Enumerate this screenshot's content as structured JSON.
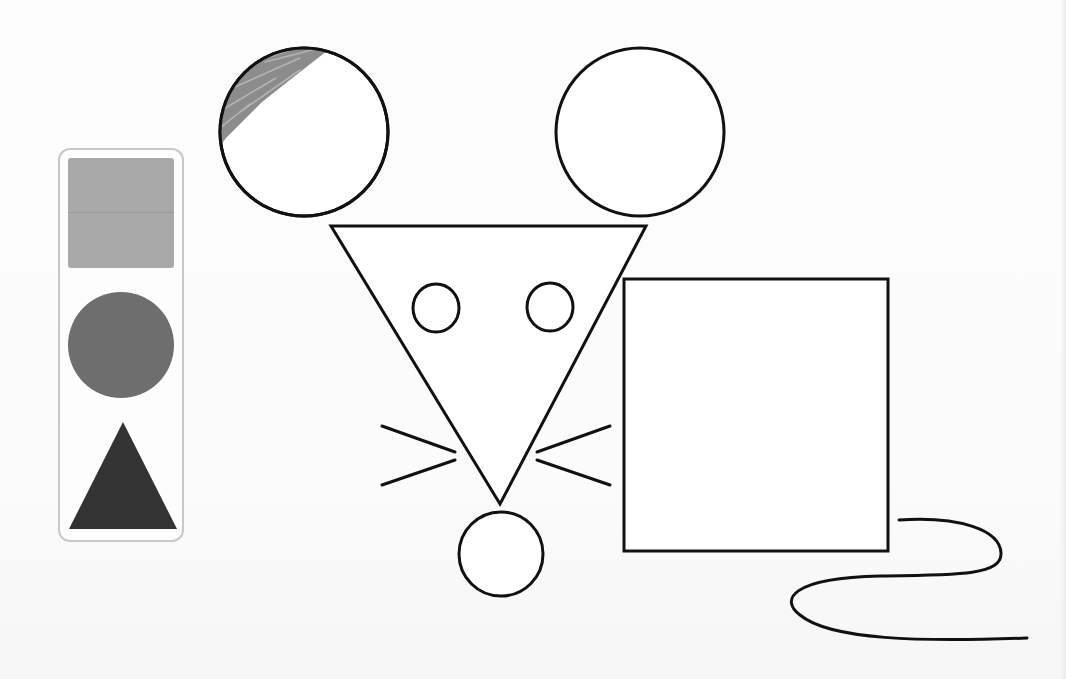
{
  "app": {
    "type": "shape-coloring-activity",
    "subject": "mouse made of shapes"
  },
  "palette": {
    "swatches": [
      {
        "id": "square",
        "shape": "square-icon",
        "color": "#a9a9a9"
      },
      {
        "id": "circle",
        "shape": "circle-icon",
        "color": "#6e6e6e"
      },
      {
        "id": "triangle",
        "shape": "triangle-icon",
        "color": "#333333"
      }
    ],
    "border_color": "#c8c8c8"
  },
  "drawing": {
    "stroke_color": "#111111",
    "shapes": {
      "left_ear": {
        "shape": "circle",
        "cx": 304,
        "cy": 132,
        "r": 84,
        "partially_colored": true,
        "fill_color": "#8c8c8c"
      },
      "right_ear": {
        "shape": "circle",
        "cx": 640,
        "cy": 132,
        "r": 84,
        "partially_colored": false
      },
      "head": {
        "shape": "triangle",
        "points": "331,226 646,226 500,504"
      },
      "left_eye": {
        "shape": "circle",
        "cx": 436,
        "cy": 308,
        "rx": 23,
        "ry": 24
      },
      "right_eye": {
        "shape": "circle",
        "cx": 550,
        "cy": 307,
        "rx": 23,
        "ry": 24
      },
      "nose": {
        "shape": "circle",
        "cx": 501,
        "cy": 554,
        "r": 42
      },
      "body": {
        "shape": "square",
        "x": 624,
        "y": 279,
        "width": 264,
        "height": 272
      },
      "whiskers": [
        {
          "x1": 382,
          "y1": 426,
          "x2": 455,
          "y2": 452
        },
        {
          "x1": 382,
          "y1": 485,
          "x2": 455,
          "y2": 460
        },
        {
          "x1": 537,
          "y1": 452,
          "x2": 610,
          "y2": 426
        },
        {
          "x1": 537,
          "y1": 460,
          "x2": 610,
          "y2": 485
        }
      ],
      "tail": {
        "shape": "curve",
        "d": "M 899 520 C 960 516, 1000 530, 1001 553 C 1002 575, 960 575, 880 576 C 790 578, 780 600, 800 615 C 830 640, 920 642, 1027 638"
      }
    }
  }
}
